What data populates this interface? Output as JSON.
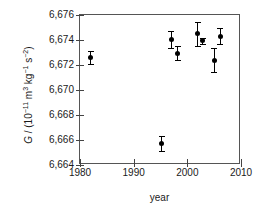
{
  "chart_data": {
    "type": "scatter",
    "title": "",
    "xlabel": "year",
    "ylabel": "G / (10-11 m3 kg-1 s-2)",
    "ylabel_parts": {
      "symbol": "G",
      "separator": " / (10",
      "exp1": "−11",
      "unit1": " m",
      "exp2": "3",
      "unit2": " kg",
      "exp3": "−1",
      "unit3": " s",
      "exp4": "−2",
      "close": ")"
    },
    "xlim": [
      1980,
      2010
    ],
    "ylim": [
      6664,
      6676
    ],
    "xticks": [
      1980,
      1990,
      2000,
      2010
    ],
    "xticklabels": [
      "1980",
      "1990",
      "2000",
      "2010"
    ],
    "yticks": [
      6664,
      6666,
      6668,
      6670,
      6672,
      6674,
      6676
    ],
    "yticklabels": [
      "6,664",
      "6,666",
      "6,668",
      "6,670",
      "6,672",
      "6,674",
      "6,676"
    ],
    "grid": false,
    "legend": null,
    "marker_color": "#000000",
    "axis_color": "#555555",
    "background": "#ffffff",
    "points": [
      {
        "x": 1982.0,
        "y": 6672.6,
        "yerr": 0.55
      },
      {
        "x": 1995.2,
        "y": 6665.7,
        "yerr": 0.6
      },
      {
        "x": 1997.0,
        "y": 6674.05,
        "yerr": 0.65
      },
      {
        "x": 1998.2,
        "y": 6672.95,
        "yerr": 0.55
      },
      {
        "x": 2001.9,
        "y": 6674.5,
        "yerr": 0.95
      },
      {
        "x": 2002.9,
        "y": 6673.95,
        "yerr": 0.25
      },
      {
        "x": 2005.0,
        "y": 6672.4,
        "yerr": 0.95
      },
      {
        "x": 2006.1,
        "y": 6674.3,
        "yerr": 0.65
      }
    ]
  }
}
